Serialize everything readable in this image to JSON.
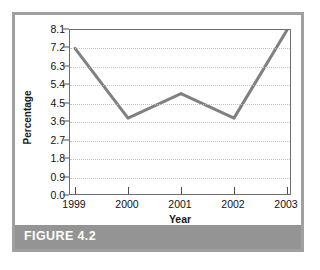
{
  "figure": {
    "caption": "FIGURE 4.2",
    "frame_color": "#a0a0a0",
    "caption_bar_color": "#949494",
    "caption_text_color": "#ffffff"
  },
  "chart_data": {
    "type": "line",
    "title": "",
    "xlabel": "Year",
    "ylabel": "Percentage",
    "categories": [
      "1999",
      "2000",
      "2001",
      "2002",
      "2003"
    ],
    "values": [
      7.2,
      3.8,
      5.0,
      3.8,
      8.1
    ],
    "series": [
      {
        "name": "Percentage",
        "values": [
          7.2,
          3.8,
          5.0,
          3.8,
          8.1
        ],
        "color": "#808080"
      }
    ],
    "ylim": [
      0.0,
      8.1
    ],
    "ytick_labels": [
      "0.0",
      "0.9",
      "1.8",
      "2.7",
      "3.6",
      "4.5",
      "5.4",
      "6.3",
      "7.2",
      "8.1"
    ],
    "ytick_values": [
      0.0,
      0.9,
      1.8,
      2.7,
      3.6,
      4.5,
      5.4,
      6.3,
      7.2,
      8.1
    ],
    "xtick_labels": [
      "1999",
      "2000",
      "2001",
      "2002",
      "2003"
    ],
    "grid": true,
    "grid_style": "dotted",
    "grid_color": "#c4c4c4",
    "legend": false,
    "legend_position": "none",
    "line_color": "#808080",
    "line_width": 3,
    "markers": false,
    "plot_background": "#ffffff",
    "axis_color": "#6e6e6e"
  }
}
